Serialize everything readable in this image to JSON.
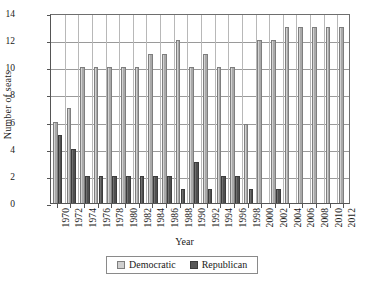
{
  "chart_data": {
    "type": "bar",
    "title": "",
    "xlabel": "Year",
    "ylabel": "Number of seats",
    "ylim": [
      0,
      14
    ],
    "ytick_step": 2,
    "yticks": [
      0,
      2,
      4,
      6,
      8,
      10,
      12,
      14
    ],
    "grid": "horizontal-and-vertical",
    "legend_position": "below-axis-centered",
    "categories": [
      "1970",
      "1972",
      "1974",
      "1976",
      "1978",
      "1980",
      "1982",
      "1984",
      "1986",
      "1988",
      "1990",
      "1992",
      "1994",
      "1996",
      "1998",
      "2000",
      "2002",
      "2004",
      "2006",
      "2008",
      "2010",
      "2012"
    ],
    "series": [
      {
        "name": "Democratic",
        "color": "#cfcfcf",
        "values": [
          6,
          7,
          10,
          10,
          10,
          10,
          10,
          11,
          11,
          12,
          10,
          11,
          10,
          10,
          5.8,
          12,
          12,
          13,
          13,
          13,
          13,
          13
        ]
      },
      {
        "name": "Republican",
        "color": "#585858",
        "values": [
          5,
          4,
          2,
          2,
          2,
          2,
          2,
          2,
          2,
          1,
          3,
          1,
          2,
          2,
          1,
          0,
          1,
          0,
          0,
          0,
          0,
          0
        ]
      }
    ]
  },
  "legend": {
    "items": [
      {
        "label": "Democratic",
        "swatch": "democratic-swatch"
      },
      {
        "label": "Republican",
        "swatch": "republican-swatch"
      }
    ]
  },
  "axes": {
    "y_title": "Number of seats",
    "x_title": "Year"
  }
}
